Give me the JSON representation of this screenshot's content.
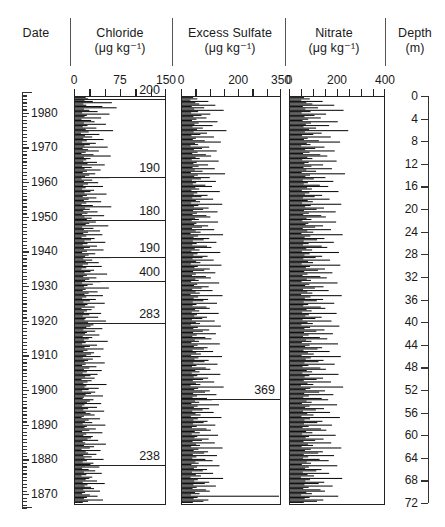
{
  "figure": {
    "columns": [
      {
        "key": "date",
        "title": "Date",
        "units": ""
      },
      {
        "key": "cl",
        "title": "Chloride",
        "units": "(μg  kg⁻¹)"
      },
      {
        "key": "so4",
        "title": "Excess Sulfate",
        "units": "(μg  kg⁻¹)"
      },
      {
        "key": "no3",
        "title": "Nitrate",
        "units": "(μg  kg⁻¹)"
      },
      {
        "key": "depth",
        "title": "Depth",
        "units": "(m)"
      }
    ]
  },
  "date_axis": {
    "label": "Date",
    "top_year": 1986,
    "bottom_year": 1866,
    "minor_step": 1,
    "major_step": 10,
    "ticks": [
      1980,
      1970,
      1960,
      1950,
      1940,
      1930,
      1920,
      1910,
      1900,
      1890,
      1880,
      1870
    ]
  },
  "depth_axis": {
    "label": "Depth",
    "units": "(m)",
    "min": 0,
    "max": 72,
    "step": 4,
    "ticks": [
      0,
      4,
      8,
      12,
      16,
      20,
      24,
      28,
      32,
      36,
      40,
      44,
      48,
      52,
      56,
      60,
      64,
      68,
      72
    ]
  },
  "chart_data": [
    {
      "type": "bar",
      "orientation": "horizontal",
      "title": "Chloride",
      "xlabel": "(μg kg⁻¹)",
      "ylabel": "Date",
      "xlim": [
        0,
        150
      ],
      "xticks": [
        0,
        75,
        150
      ],
      "xtick_labels": [
        "0",
        "75",
        "150"
      ],
      "minor_xticks": [
        0,
        25,
        50,
        75,
        100,
        125,
        150
      ],
      "grid": false,
      "legend": null,
      "annotations": [
        {
          "value": "200",
          "year": 1984.0
        },
        {
          "value": "190",
          "year": 1961.5
        },
        {
          "value": "180",
          "year": 1949.0
        },
        {
          "value": "190",
          "year": 1938.5
        },
        {
          "value": "400",
          "year": 1931.5
        },
        {
          "value": "283",
          "year": 1919.5
        },
        {
          "value": "238",
          "year": 1878.5
        }
      ],
      "values": [
        18,
        22,
        16,
        30,
        62,
        14,
        19,
        46,
        70,
        15,
        24,
        38,
        12,
        58,
        20,
        16,
        44,
        11,
        27,
        33,
        15,
        52,
        21,
        13,
        36,
        18,
        64,
        23,
        10,
        41,
        17,
        29,
        14,
        48,
        20,
        12,
        35,
        25,
        16,
        55,
        13,
        22,
        40,
        18,
        11,
        31,
        60,
        15,
        26,
        19,
        14,
        37,
        21,
        50,
        12,
        28,
        16,
        43,
        20,
        13,
        34,
        24,
        17,
        58,
        11,
        29,
        15,
        39,
        22,
        14,
        47,
        18,
        12,
        32,
        26,
        16,
        53,
        20,
        13,
        36,
        23,
        15,
        44,
        19,
        11,
        30,
        61,
        17,
        25,
        14,
        38,
        21,
        12,
        49,
        16,
        28,
        20,
        13,
        35,
        24,
        18,
        56,
        12,
        31,
        15,
        42,
        22,
        14,
        46,
        19,
        11,
        33,
        27,
        16,
        51,
        21,
        13,
        37,
        25,
        15,
        48,
        20,
        12,
        34,
        23,
        17,
        59,
        14,
        29,
        18,
        40,
        22,
        13,
        45,
        19,
        11,
        32,
        26,
        16,
        54,
        20,
        14,
        36,
        24,
        17,
        43,
        12,
        30,
        21,
        15,
        57,
        18,
        13,
        38,
        23,
        16,
        47,
        19,
        12,
        35,
        25,
        14,
        50,
        21,
        17,
        33,
        11,
        28,
        20,
        15,
        44,
        24,
        13,
        39,
        18,
        16,
        52,
        22,
        12,
        31,
        26,
        19,
        46,
        14,
        34,
        20,
        17,
        41,
        13,
        29,
        23,
        15,
        55,
        18,
        12,
        37,
        25,
        16,
        48,
        21,
        14,
        32,
        27,
        19,
        43,
        13,
        30,
        22,
        16,
        50,
        18,
        12,
        36,
        24,
        15,
        45,
        20,
        13,
        38,
        26,
        17,
        33,
        11,
        28,
        21,
        14,
        53,
        19,
        16,
        40,
        23,
        12,
        34,
        27,
        18,
        47,
        15,
        13,
        31,
        25,
        20,
        44,
        16,
        12,
        37,
        22,
        14,
        49,
        18,
        26,
        33,
        15,
        11,
        42,
        23,
        17,
        29,
        13,
        51,
        20,
        16,
        35,
        24,
        12,
        46,
        19,
        14,
        30,
        27,
        21,
        39,
        13,
        17,
        52,
        15,
        32,
        25,
        11,
        43,
        18,
        22,
        36,
        14,
        28,
        16,
        48,
        20,
        13,
        31,
        26,
        17,
        41,
        12,
        23,
        34,
        15,
        45,
        19,
        11,
        29,
        24,
        18,
        37,
        13,
        50,
        21,
        16,
        27,
        32,
        14,
        42,
        17,
        12,
        25,
        38,
        20,
        15,
        47,
        22,
        13
      ]
    },
    {
      "type": "bar",
      "orientation": "horizontal",
      "title": "Excess Sulfate",
      "xlabel": "(μg kg⁻¹)",
      "ylabel": "Date",
      "xlim": [
        0,
        350
      ],
      "xticks": [
        0,
        200,
        350
      ],
      "xtick_labels": [
        "0",
        "200",
        "350"
      ],
      "minor_xticks": [
        0,
        50,
        100,
        150,
        200,
        250,
        300,
        350
      ],
      "grid": false,
      "legend": null,
      "annotations": [
        {
          "value": "369",
          "year": 1897.5
        }
      ],
      "values": [
        40,
        55,
        30,
        95,
        48,
        62,
        120,
        35,
        80,
        44,
        150,
        58,
        33,
        102,
        70,
        41,
        88,
        52,
        36,
        128,
        60,
        45,
        110,
        38,
        75,
        54,
        160,
        42,
        90,
        66,
        34,
        115,
        50,
        39,
        82,
        140,
        47,
        58,
        31,
        98,
        72,
        43,
        125,
        56,
        37,
        86,
        105,
        49,
        64,
        35,
        132,
        53,
        41,
        94,
        60,
        38,
        118,
        46,
        74,
        32,
        155,
        57,
        44,
        100,
        68,
        36,
        122,
        51,
        39,
        84,
        108,
        48,
        62,
        34,
        136,
        55,
        42,
        92,
        70,
        37,
        112,
        50,
        65,
        33,
        145,
        59,
        43,
        96,
        76,
        40,
        128,
        54,
        38,
        88,
        102,
        47,
        61,
        35,
        130,
        52,
        44,
        94,
        72,
        36,
        116,
        49,
        67,
        31,
        148,
        58,
        42,
        98,
        78,
        39,
        124,
        53,
        37,
        90,
        106,
        46,
        63,
        34,
        138,
        56,
        41,
        92,
        74,
        38,
        114,
        51,
        66,
        32,
        142,
        57,
        45,
        100,
        80,
        40,
        120,
        50,
        36,
        86,
        104,
        48,
        60,
        33,
        134,
        55,
        43,
        96,
        71,
        37,
        110,
        49,
        64,
        31,
        146,
        58,
        42,
        94,
        77,
        39,
        126,
        52,
        38,
        88,
        100,
        47,
        62,
        35,
        132,
        54,
        44,
        90,
        73,
        36,
        118,
        50,
        65,
        32,
        140,
        57,
        41,
        98,
        75,
        40,
        122,
        53,
        37,
        84,
        106,
        46,
        61,
        34,
        136,
        56,
        43,
        92,
        79,
        38,
        112,
        51,
        68,
        33,
        144,
        59,
        45,
        96,
        81,
        41,
        128,
        52,
        36,
        86,
        102,
        48,
        63,
        35,
        138,
        55,
        42,
        94,
        76,
        39,
        116,
        50,
        66,
        31,
        150,
        58,
        44,
        100,
        83,
        40,
        124,
        54,
        38,
        90,
        108,
        47,
        62,
        34,
        133,
        56,
        43,
        98,
        74,
        37,
        114,
        49,
        67,
        32,
        142,
        57,
        41,
        92,
        78,
        40,
        120,
        53,
        36,
        88,
        104,
        46,
        64,
        35,
        130,
        55,
        45,
        96,
        72,
        38,
        118,
        51,
        65,
        33,
        146,
        59,
        42,
        94,
        80,
        39,
        126,
        52,
        37,
        84,
        110,
        48,
        60,
        34,
        135,
        54,
        43,
        90,
        75,
        36,
        112,
        50,
        68,
        31,
        148,
        57,
        44,
        98,
        82,
        41,
        122,
        53,
        38,
        86,
        100,
        47,
        63,
        32,
        369,
        56,
        42,
        95,
        77,
        39
      ]
    },
    {
      "type": "bar",
      "orientation": "horizontal",
      "title": "Nitrate",
      "xlabel": "(μg kg⁻¹)",
      "ylabel": "Date",
      "xlim": [
        0,
        400
      ],
      "xticks": [
        0,
        200,
        400
      ],
      "xtick_labels": [
        "0",
        "200",
        "400"
      ],
      "minor_xticks": [
        0,
        50,
        100,
        150,
        200,
        250,
        300,
        350,
        400
      ],
      "grid": false,
      "legend": null,
      "annotations": [],
      "values": [
        60,
        85,
        48,
        140,
        70,
        96,
        190,
        55,
        120,
        66,
        230,
        88,
        50,
        155,
        105,
        62,
        132,
        78,
        54,
        205,
        90,
        68,
        168,
        58,
        112,
        82,
        250,
        64,
        136,
        100,
        52,
        175,
        76,
        60,
        124,
        215,
        72,
        88,
        48,
        148,
        108,
        65,
        192,
        84,
        56,
        130,
        160,
        74,
        96,
        53,
        200,
        80,
        62,
        142,
        92,
        58,
        180,
        70,
        112,
        50,
        236,
        86,
        66,
        152,
        102,
        55,
        186,
        77,
        59,
        128,
        164,
        73,
        94,
        51,
        208,
        83,
        64,
        138,
        106,
        56,
        170,
        76,
        98,
        52,
        220,
        89,
        65,
        146,
        114,
        60,
        196,
        81,
        57,
        134,
        154,
        71,
        92,
        53,
        198,
        79,
        67,
        142,
        108,
        55,
        176,
        74,
        100,
        49,
        226,
        87,
        63,
        148,
        116,
        59,
        188,
        80,
        56,
        136,
        160,
        70,
        95,
        51,
        210,
        84,
        62,
        138,
        110,
        57,
        172,
        77,
        99,
        50,
        216,
        86,
        68,
        150,
        120,
        61,
        182,
        75,
        54,
        130,
        158,
        72,
        90,
        50,
        204,
        83,
        65,
        144,
        107,
        56,
        166,
        74,
        96,
        48,
        222,
        88,
        64,
        142,
        115,
        59,
        190,
        78,
        57,
        132,
        152,
        71,
        93,
        52,
        200,
        81,
        66,
        136,
        109,
        54,
        178,
        75,
        98,
        49,
        212,
        86,
        62,
        148,
        113,
        60,
        184,
        80,
        56,
        128,
        160,
        69,
        92,
        51,
        206,
        84,
        65,
        138,
        118,
        58,
        170,
        77,
        102,
        50,
        218,
        89,
        68,
        144,
        122,
        62,
        192,
        79,
        54,
        130,
        154,
        72,
        95,
        53,
        208,
        83,
        63,
        142,
        114,
        59,
        176,
        75,
        100,
        47,
        228,
        87,
        67,
        150,
        125,
        61,
        186,
        81,
        57,
        136,
        164,
        71,
        93,
        51,
        202,
        84,
        65,
        146,
        111,
        56,
        172,
        74,
        101,
        49,
        214,
        86,
        62,
        139,
        117,
        60,
        180,
        80,
        54,
        133,
        156,
        69,
        96,
        52,
        196,
        82,
        67,
        144,
        108,
        58,
        177,
        77,
        99,
        50,
        220,
        89,
        64,
        141,
        121,
        59,
        189,
        78,
        56,
        127,
        166,
        72,
        90,
        51,
        203,
        81,
        65,
        135,
        113,
        55,
        168,
        75,
        103,
        47,
        224,
        86,
        66,
        147,
        123,
        62,
        183,
        80,
        57,
        131,
        150,
        70,
        94,
        48,
        207,
        84,
        63,
        143,
        116,
        59
      ]
    }
  ]
}
